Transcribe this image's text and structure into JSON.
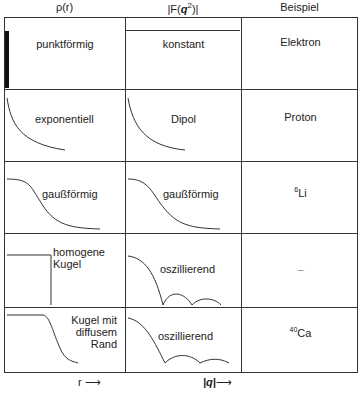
{
  "headers": {
    "col1": "ρ(r)",
    "col2": "|F(q²)|",
    "col2_parts": {
      "pre": "|F(",
      "q": "q",
      "sup": "2",
      "post": ")|"
    },
    "col3": "Beispiel"
  },
  "rows": [
    {
      "rho": "punktförmig",
      "form": "konstant",
      "example": "Elektron"
    },
    {
      "rho": "exponentiell",
      "form": "Dipol",
      "example": "Proton"
    },
    {
      "rho": "gaußförmig",
      "form": "gaußförmig",
      "example_sup": "6",
      "example": "Li"
    },
    {
      "rho_line1": "homogene",
      "rho_line2": "Kugel",
      "form": "oszillierend",
      "example": "–"
    },
    {
      "rho_line1": "Kugel mit",
      "rho_line2": "diffusem",
      "rho_line3": "Rand",
      "form": "oszillierend",
      "example_sup": "40",
      "example": "Ca"
    }
  ],
  "footer": {
    "x1": "r",
    "x2": "|q|"
  }
}
